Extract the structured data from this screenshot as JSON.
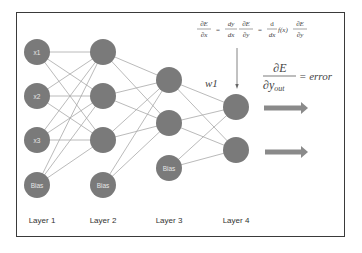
{
  "diagram": {
    "type": "neural-network",
    "colors": {
      "node_fill": "#7a7a7a",
      "edge": "#a8a8a8",
      "arrow": "#8a8a8a",
      "frame": "#3a3a3a",
      "node_text": "#e6e6e6"
    },
    "layers": [
      {
        "label": "Layer 1",
        "nodes": [
          {
            "label": "x1",
            "x": 37,
            "y": 52
          },
          {
            "label": "x2",
            "x": 37,
            "y": 96
          },
          {
            "label": "x3",
            "x": 37,
            "y": 140
          },
          {
            "label": "Bias",
            "x": 37,
            "y": 185
          }
        ]
      },
      {
        "label": "Layer 2",
        "nodes": [
          {
            "label": "",
            "x": 103,
            "y": 52
          },
          {
            "label": "",
            "x": 103,
            "y": 96
          },
          {
            "label": "",
            "x": 103,
            "y": 140
          },
          {
            "label": "Bias",
            "x": 103,
            "y": 185
          }
        ]
      },
      {
        "label": "Layer 3",
        "nodes": [
          {
            "label": "",
            "x": 169,
            "y": 80
          },
          {
            "label": "",
            "x": 169,
            "y": 123
          },
          {
            "label": "Bias",
            "x": 169,
            "y": 168
          }
        ]
      },
      {
        "label": "Layer 4",
        "nodes": [
          {
            "label": "",
            "x": 236,
            "y": 107
          },
          {
            "label": "",
            "x": 236,
            "y": 150
          }
        ]
      }
    ],
    "weight_label": "w1",
    "chain_rule": {
      "lhs_num": "∂E",
      "lhs_den": "∂x",
      "eq": "=",
      "t1_num": "dy",
      "t1_den": "dx",
      "t2_num": "∂E",
      "t2_den": "∂y",
      "t3_num": "d",
      "t3_den": "dx",
      "fx": "f(x)",
      "t4_num": "∂E",
      "t4_den": "∂y"
    },
    "error_formula": {
      "num": "∂E",
      "den": "∂y",
      "den_sub": "out",
      "rhs": "= error"
    }
  }
}
